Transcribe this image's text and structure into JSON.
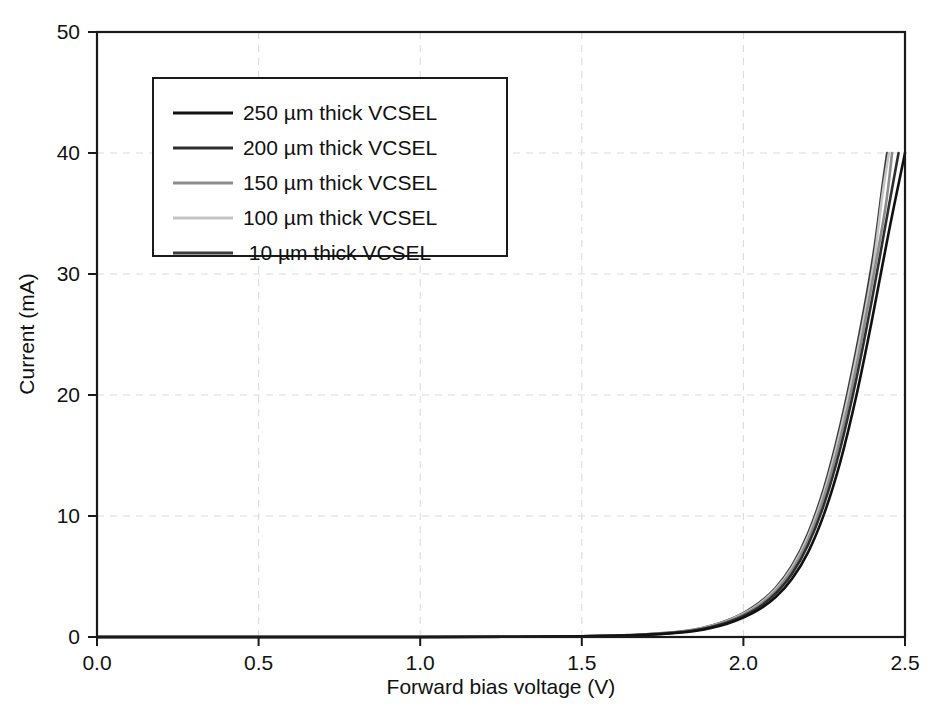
{
  "chart_data": {
    "type": "line",
    "title": "",
    "xlabel": "Forward bias voltage (V)",
    "ylabel": "Current (mA)",
    "xlim": [
      0.0,
      2.5
    ],
    "ylim": [
      0,
      50
    ],
    "xticks": [
      "0.0",
      "0.5",
      "1.0",
      "1.5",
      "2.0",
      "2.5"
    ],
    "xtick_values": [
      0.0,
      0.5,
      1.0,
      1.5,
      2.0,
      2.5
    ],
    "yticks": [
      "0",
      "10",
      "20",
      "30",
      "40",
      "50"
    ],
    "ytick_values": [
      0,
      10,
      20,
      30,
      40,
      50
    ],
    "grid": "dashed light gray, both axes",
    "legend_position": "upper left inside axes",
    "series": [
      {
        "name": "250 µm thick VCSEL",
        "color": "#111111",
        "x": [
          0.0,
          0.5,
          1.0,
          1.3,
          1.5,
          1.6,
          1.7,
          1.8,
          1.85,
          1.9,
          1.95,
          2.0,
          2.05,
          2.1,
          2.15,
          2.2,
          2.25,
          2.3,
          2.35,
          2.4,
          2.45,
          2.5
        ],
        "y": [
          0.0,
          0.0,
          0.0,
          0.02,
          0.05,
          0.1,
          0.18,
          0.35,
          0.5,
          0.75,
          1.1,
          1.6,
          2.3,
          3.3,
          4.8,
          7.0,
          10.2,
          14.5,
          20.0,
          26.5,
          33.5,
          40.0
        ]
      },
      {
        "name": "200 µm thick VCSEL",
        "color": "#2e2e2e",
        "x": [
          0.0,
          0.5,
          1.0,
          1.3,
          1.5,
          1.6,
          1.7,
          1.8,
          1.85,
          1.9,
          1.95,
          2.0,
          2.05,
          2.1,
          2.15,
          2.2,
          2.25,
          2.3,
          2.35,
          2.4,
          2.45,
          2.48
        ],
        "y": [
          0.0,
          0.0,
          0.0,
          0.02,
          0.05,
          0.1,
          0.2,
          0.38,
          0.55,
          0.82,
          1.2,
          1.75,
          2.5,
          3.6,
          5.2,
          7.6,
          11.0,
          15.6,
          21.4,
          28.2,
          35.6,
          40.0
        ]
      },
      {
        "name": "150 µm thick VCSEL",
        "color": "#8c8c8c",
        "x": [
          0.0,
          0.5,
          1.0,
          1.3,
          1.5,
          1.6,
          1.7,
          1.8,
          1.85,
          1.9,
          1.95,
          2.0,
          2.05,
          2.1,
          2.15,
          2.2,
          2.25,
          2.3,
          2.35,
          2.4,
          2.44,
          2.46
        ],
        "y": [
          0.0,
          0.0,
          0.0,
          0.02,
          0.05,
          0.11,
          0.21,
          0.4,
          0.58,
          0.87,
          1.28,
          1.85,
          2.65,
          3.8,
          5.5,
          8.0,
          11.6,
          16.4,
          22.4,
          29.5,
          35.6,
          40.0
        ]
      },
      {
        "name": "100 µm thick VCSEL",
        "color": "#c4c4c4",
        "x": [
          0.0,
          0.5,
          1.0,
          1.3,
          1.5,
          1.6,
          1.7,
          1.8,
          1.85,
          1.9,
          1.95,
          2.0,
          2.05,
          2.1,
          2.15,
          2.2,
          2.25,
          2.3,
          2.35,
          2.4,
          2.43,
          2.45
        ],
        "y": [
          0.0,
          0.0,
          0.0,
          0.02,
          0.06,
          0.12,
          0.22,
          0.42,
          0.6,
          0.9,
          1.33,
          1.92,
          2.75,
          3.95,
          5.7,
          8.3,
          12.0,
          17.0,
          23.2,
          30.4,
          36.5,
          40.0
        ]
      },
      {
        "name": "10 µm thick VCSEL",
        "color": "#3a3a3a",
        "x": [
          0.0,
          0.5,
          1.0,
          1.3,
          1.5,
          1.6,
          1.7,
          1.8,
          1.85,
          1.9,
          1.95,
          2.0,
          2.05,
          2.1,
          2.15,
          2.2,
          2.25,
          2.3,
          2.35,
          2.4,
          2.43,
          2.445
        ],
        "y": [
          0.0,
          0.0,
          0.0,
          0.02,
          0.06,
          0.12,
          0.23,
          0.43,
          0.62,
          0.93,
          1.37,
          1.98,
          2.84,
          4.07,
          5.87,
          8.55,
          12.35,
          17.5,
          23.8,
          31.2,
          37.2,
          40.0
        ]
      }
    ]
  },
  "legend": {
    "entries": [
      {
        "label": "250 µm thick VCSEL"
      },
      {
        "label": "200 µm thick VCSEL"
      },
      {
        "label": "150 µm thick VCSEL"
      },
      {
        "label": "100 µm thick VCSEL"
      },
      {
        "label": "10 µm thick VCSEL"
      }
    ]
  },
  "axes": {
    "x_title": "Forward bias voltage (V)",
    "y_title": "Current (mA)",
    "x_tick_labels": [
      "0.0",
      "0.5",
      "1.0",
      "1.5",
      "2.0",
      "2.5"
    ],
    "y_tick_labels": [
      "0",
      "10",
      "20",
      "30",
      "40",
      "50"
    ]
  }
}
